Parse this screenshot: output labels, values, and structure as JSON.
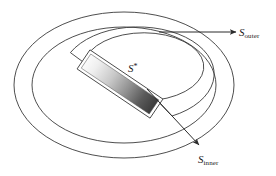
{
  "figure": {
    "type": "diagram",
    "width": 276,
    "height": 176,
    "background": "#ffffff",
    "stroke_color": "#3a3a3a",
    "stroke_width": 0.9
  },
  "labels": {
    "outer": {
      "base": "S",
      "sub": "outer",
      "full": "S_outer"
    },
    "inner": {
      "base": "S",
      "sub": "inner",
      "full": "S_inner"
    },
    "star": {
      "base": "S",
      "sup": "*",
      "full": "S*"
    }
  },
  "shapes": {
    "outer_ellipse": {
      "name": "outer-ellipse",
      "cx": 124,
      "cy": 85,
      "rx": 110,
      "ry": 73
    },
    "mid_ellipse": {
      "name": "mid-ellipse",
      "cx": 124,
      "cy": 85,
      "rx": 92,
      "ry": 58
    },
    "inner_slot": {
      "name": "inner-slot-band",
      "cx": 124,
      "cy": 85,
      "rx_outer": 76,
      "ry_outer": 47,
      "rx_inner": 60,
      "ry_inner": 34,
      "gap_angle_deg": 42
    },
    "gradient_bar": {
      "name": "gradient-bar",
      "angle_deg": 34,
      "length": 82,
      "thickness": 17,
      "color_start": "#f2f2f2",
      "color_end": "#3f3f3f",
      "outline": "#4a4a4a"
    }
  },
  "arrows": {
    "outer": {
      "name": "s-outer-arrow",
      "x1": 159,
      "y1": 32,
      "x2": 236,
      "y2": 32,
      "color": "#2b2b2b"
    },
    "inner": {
      "name": "s-inner-arrow",
      "x1": 147,
      "y1": 89,
      "x2": 200,
      "y2": 146,
      "color": "#2b2b2b"
    }
  },
  "colors": {
    "stroke": "#3a3a3a",
    "arrow": "#2b2b2b",
    "text": "#1a1a1a",
    "bar_light": "#f2f2f2",
    "bar_dark": "#3f3f3f"
  }
}
